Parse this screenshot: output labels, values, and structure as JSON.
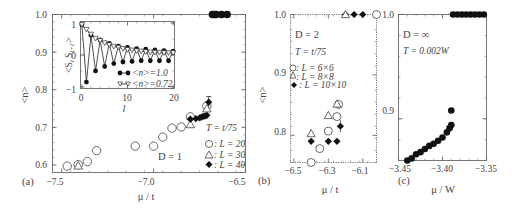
{
  "figure": {
    "panels": [
      "(a)",
      "(b)",
      "(c)"
    ]
  },
  "chart_data": [
    {
      "panel": "(a)",
      "type": "scatter",
      "xlabel": "μ / t",
      "ylabel": "<n>",
      "xlim": [
        -7.55,
        -6.5
      ],
      "ylim": [
        0.58,
        1.0
      ],
      "xticks": [
        -7.5,
        -7.0,
        -6.5
      ],
      "xtick_labels": [
        "−7.5",
        "−7.0",
        "−6.5"
      ],
      "yticks": [
        0.6,
        0.7,
        0.8,
        0.9,
        1.0
      ],
      "ytick_labels": [
        "0.6",
        "0.7",
        "0.8",
        "0.9",
        "1.0"
      ],
      "annotations": {
        "dimension": "D = 1",
        "temperature": "T = t/75"
      },
      "legend": [
        {
          "marker": "circle-open",
          "label": ": L = 20"
        },
        {
          "marker": "triangle-open",
          "label": ": L = 30"
        },
        {
          "marker": "diamond-filled",
          "label": ": L = 40"
        }
      ],
      "series": [
        {
          "name": "L = 20",
          "marker": "circle-open",
          "x": [
            -7.47,
            -7.41,
            -7.36,
            -7.31,
            -7.1,
            -7.0,
            -6.95,
            -6.9,
            -6.85,
            -6.8,
            -6.71
          ],
          "y": [
            0.597,
            0.601,
            0.609,
            0.638,
            0.65,
            0.65,
            0.674,
            0.698,
            0.701,
            0.728,
            0.757
          ]
        },
        {
          "name": "L = 30",
          "marker": "triangle-open",
          "x": [
            -7.41,
            -6.8,
            -6.71
          ],
          "y": [
            0.598,
            0.708,
            0.75
          ]
        },
        {
          "name": "L = 40",
          "marker": "diamond-filled",
          "x": [
            -6.8,
            -6.77,
            -6.75,
            -6.74,
            -6.73,
            -6.72,
            -6.71,
            -6.7
          ],
          "y": [
            0.722,
            0.723,
            0.725,
            0.727,
            0.729,
            0.73,
            0.732,
            0.767
          ],
          "yerr_last": 0.015
        },
        {
          "name": "<n>=1 branch",
          "marker": "circle-filled",
          "x": [
            -6.68,
            -6.67,
            -6.66,
            -6.63,
            -6.6
          ],
          "y": [
            1.0,
            1.0,
            1.0,
            1.0,
            1.0
          ]
        }
      ],
      "inset": {
        "type": "line",
        "xlabel": "l",
        "ylabel": "<S_l S_{l+l'}>",
        "xlim": [
          0,
          20
        ],
        "ylim": [
          -1,
          1
        ],
        "xticks": [
          0,
          10,
          20
        ],
        "yticks": [
          -1,
          0,
          1
        ],
        "legend": [
          {
            "marker": "circle-filled",
            "label": "<n>=1.0"
          },
          {
            "marker": "triangle-down-open",
            "label": "<n>=0.72"
          }
        ],
        "series": [
          {
            "name": "<n>=1.0",
            "x": [
              0,
              1,
              2,
              3,
              4,
              5,
              6,
              7,
              8,
              9,
              10,
              11,
              12,
              13,
              14,
              15,
              16,
              17,
              18,
              19,
              20
            ],
            "y": [
              0.95,
              -0.85,
              0.62,
              -0.5,
              0.47,
              -0.36,
              0.36,
              -0.27,
              0.28,
              -0.22,
              0.24,
              -0.2,
              0.2,
              -0.18,
              0.18,
              -0.18,
              0.16,
              -0.18,
              0.14,
              -0.18,
              0.12
            ]
          },
          {
            "name": "<n>=0.72",
            "x": [
              0,
              1,
              2,
              3,
              4,
              5,
              6,
              7,
              8,
              9,
              10,
              11,
              12,
              13,
              14,
              15,
              16,
              17,
              18,
              19,
              20
            ],
            "y": [
              0.95,
              0.8,
              0.65,
              0.52,
              0.45,
              0.38,
              0.32,
              0.27,
              0.24,
              0.2,
              0.17,
              0.15,
              0.13,
              0.12,
              0.1,
              0.09,
              0.08,
              0.08,
              0.07,
              0.07,
              0.07
            ]
          }
        ]
      }
    },
    {
      "panel": "(b)",
      "type": "scatter",
      "xlabel": "μ / t",
      "ylabel": "<n>",
      "xlim": [
        -6.52,
        -6.02
      ],
      "ylim": [
        0.755,
        1.0
      ],
      "xticks": [
        -6.5,
        -6.3,
        -6.1
      ],
      "xtick_labels": [
        "−6.5",
        "−6.3",
        "−6.1"
      ],
      "yticks": [
        0.8,
        0.9,
        1.0
      ],
      "ytick_labels": [
        "0.8",
        "0.9",
        "1.0"
      ],
      "annotations": {
        "dimension": "D = 2",
        "temperature": "T = t/75"
      },
      "legend": [
        {
          "marker": "circle-open",
          "label": ": L = 6×6"
        },
        {
          "marker": "triangle-open",
          "label": ": L = 8×8"
        },
        {
          "marker": "diamond-filled",
          "label": ": L = 10×10"
        }
      ],
      "series": [
        {
          "name": "L = 6×6",
          "marker": "circle-open",
          "x": [
            -6.4,
            -6.35,
            -6.3,
            -6.25,
            -6.24,
            -6.02
          ],
          "y": [
            0.755,
            0.778,
            0.807,
            0.831,
            0.851,
            1.0
          ]
        },
        {
          "name": "L = 8×8",
          "marker": "triangle-open",
          "x": [
            -6.4,
            -6.3,
            -6.25
          ],
          "y": [
            0.803,
            0.833,
            0.852
          ]
        },
        {
          "name": "L = 10×10",
          "marker": "diamond-filled",
          "x": [
            -6.4,
            -6.3,
            -6.25,
            -6.23,
            -6.2,
            -6.15,
            -6.1
          ],
          "y": [
            0.79,
            0.79,
            0.79,
            0.815,
            1.0,
            1.0,
            1.0
          ],
          "yerr_index": 3,
          "yerr": 0.01
        },
        {
          "name": "L = 8×8 (n=1)",
          "marker": "triangle-open",
          "x": [
            -6.2
          ],
          "y": [
            1.0
          ]
        }
      ]
    },
    {
      "panel": "(c)",
      "type": "scatter",
      "xlabel": "μ / W",
      "ylabel": "",
      "xlim": [
        -3.45,
        -3.35
      ],
      "ylim": [
        0.86,
        1.0
      ],
      "xticks": [
        -3.45,
        -3.4,
        -3.35
      ],
      "xtick_labels": [
        "−3.45",
        "−3.40",
        "−3.35"
      ],
      "yticks": [
        0.9,
        1.0
      ],
      "ytick_labels": [
        "0.9",
        "1.0"
      ],
      "annotations": {
        "dimension": "D = ∞",
        "temperature": "T = 0.002W"
      },
      "series": [
        {
          "name": "D=∞",
          "marker": "circle-filled",
          "x": [
            -3.44,
            -3.435,
            -3.43,
            -3.425,
            -3.42,
            -3.415,
            -3.41,
            -3.405,
            -3.4,
            -3.395,
            -3.392,
            -3.39,
            -3.39,
            -3.388,
            -3.383,
            -3.378,
            -3.373,
            -3.368,
            -3.363,
            -3.358,
            -3.353
          ],
          "y": [
            0.86,
            0.862,
            0.866,
            0.868,
            0.871,
            0.874,
            0.876,
            0.879,
            0.882,
            0.887,
            0.891,
            0.894,
            0.908,
            1.0,
            1.0,
            1.0,
            1.0,
            1.0,
            1.0,
            1.0,
            1.0
          ]
        }
      ]
    }
  ],
  "labels": {
    "a": {
      "panel": "(a)",
      "xlabel": "μ / t",
      "ylabel": "<n>",
      "dim": "D = 1",
      "temp": "T = t/75",
      "leg1": ": L = 20",
      "leg2": ": L = 30",
      "leg3": ": L = 40",
      "inset_ylabel": "<S",
      "inset_xlabel": "l",
      "inset_leg1": "<n>=1.0",
      "inset_leg2": "<n>=0.72",
      "xt": [
        "−7.5",
        "−7.0",
        "−6.5"
      ],
      "yt": [
        "0.6",
        "0.7",
        "0.8",
        "0.9",
        "1.0"
      ],
      "ixt": [
        "0",
        "10",
        "20"
      ],
      "iyt": [
        "−1",
        "0",
        "1"
      ]
    },
    "b": {
      "panel": "(b)",
      "xlabel": "μ / t",
      "ylabel": "<n>",
      "dim": "D = 2",
      "temp": "T = t/75",
      "leg1": ": L = 6×6",
      "leg2": ": L = 8×8",
      "leg3": ": L = 10×10",
      "xt": [
        "−6.5",
        "−6.3",
        "−6.1"
      ],
      "yt": [
        "0.8",
        "0.9",
        "1.0"
      ]
    },
    "c": {
      "panel": "(c)",
      "xlabel": "μ / W",
      "dim": "D = ∞",
      "temp": "T = 0.002W",
      "xt": [
        "−3.45",
        "−3.40",
        "−3.35"
      ],
      "yt": [
        "0.9",
        "1.0"
      ]
    }
  }
}
